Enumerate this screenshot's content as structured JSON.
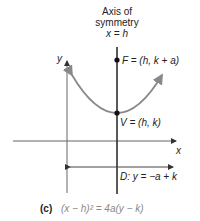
{
  "figure": {
    "axis_of_symmetry": {
      "line1": "Axis of",
      "line2": "symmetry",
      "line3": "x = h"
    },
    "labels": {
      "y_axis": "y",
      "x_axis": "x",
      "focus": "F = (h, k + a)",
      "vertex": "V = (h, k)",
      "directrix": "D: y = −a + k"
    },
    "caption": {
      "tag": "(c)",
      "equation": "(x − h)² = 4a(y − k)"
    },
    "colors": {
      "axes": "#555555",
      "parabola": "#8a8a8a",
      "symmetry_axis": "#222222",
      "points": "#111111",
      "caption_eq": "#888888"
    }
  }
}
